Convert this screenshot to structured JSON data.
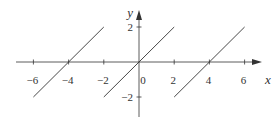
{
  "chart_data": {
    "type": "line",
    "title": "",
    "xlabel": "x",
    "ylabel": "y",
    "xlim": [
      -7,
      7
    ],
    "ylim": [
      -3,
      3
    ],
    "grid": false,
    "legend": null,
    "x_ticks": [
      -6,
      -4,
      -2,
      0,
      2,
      4,
      6
    ],
    "x_tick_labels": [
      "−6",
      "−4",
      "−2",
      "0",
      "2",
      "4",
      "6"
    ],
    "y_ticks": [
      2,
      -2
    ],
    "y_tick_labels": [
      "2",
      "−2"
    ],
    "series": [
      {
        "name": "segment-1",
        "x": [
          -6,
          -2
        ],
        "y": [
          -2,
          2
        ]
      },
      {
        "name": "segment-2",
        "x": [
          -2,
          2
        ],
        "y": [
          -2,
          2
        ]
      },
      {
        "name": "segment-3",
        "x": [
          2,
          6
        ],
        "y": [
          -2,
          2
        ]
      }
    ],
    "colors": {
      "line": "#333333",
      "axis": "#333333"
    }
  }
}
